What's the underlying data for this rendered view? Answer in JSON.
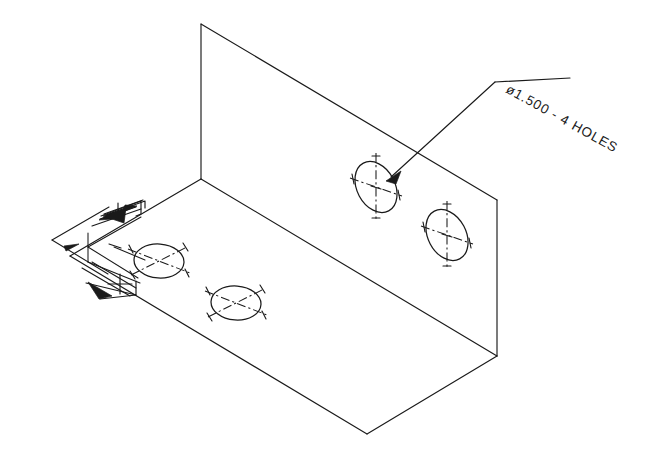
{
  "drawing": {
    "title": "Isometric bracket detail drawing",
    "background_color": "#ffffff",
    "line_color": "#1a1a1a",
    "annotations": {
      "hole_note": "ø1.500 - 4 HOLES",
      "hole_note_rotation_deg": 29,
      "hole_note_x": 505,
      "hole_note_y": 92
    },
    "part": {
      "name": "L-bracket",
      "vertical_face": {
        "top_left": [
          201,
          24
        ],
        "top_right": [
          497,
          200
        ],
        "bottom_right": [
          497,
          356
        ],
        "bottom_left": [
          201,
          179
        ]
      },
      "horizontal_face": {
        "back_left": [
          201,
          179
        ],
        "back_right": [
          497,
          356
        ],
        "front_right": [
          367,
          434
        ],
        "front_left": [
          70,
          256
        ]
      }
    },
    "holes": [
      {
        "id": "hole-vertical-left",
        "face": "vertical",
        "center_x": 376,
        "center_y": 187,
        "rx": 19,
        "ry": 27,
        "rotation_deg": -28
      },
      {
        "id": "hole-vertical-right",
        "face": "vertical",
        "center_x": 447,
        "center_y": 235,
        "rx": 19,
        "ry": 27,
        "rotation_deg": -28
      },
      {
        "id": "hole-horizontal-left",
        "face": "horizontal",
        "center_x": 159,
        "center_y": 261,
        "rx": 25,
        "ry": 17,
        "rotation_deg": 4
      },
      {
        "id": "hole-horizontal-right",
        "face": "horizontal",
        "center_x": 236,
        "center_y": 303,
        "rx": 25,
        "ry": 17,
        "rotation_deg": 4
      }
    ],
    "leader": {
      "tail_x": 570,
      "tail_y": 78,
      "elbow_x": 495,
      "elbow_y": 82,
      "tip_x": 388,
      "tip_y": 180
    },
    "dimension_detail": {
      "present": true,
      "description": "isometric dimension cluster with arrowheads and center mark",
      "arrow_count": 5
    }
  }
}
